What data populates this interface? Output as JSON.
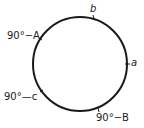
{
  "diagram": {
    "type": "circle-pentagon",
    "stroke_color": "#1a1a1a",
    "labels": {
      "top": "b",
      "right": "a",
      "upper_left": "90°−A",
      "lower_left": "90°—c",
      "bottom_right": "90°−B"
    }
  }
}
